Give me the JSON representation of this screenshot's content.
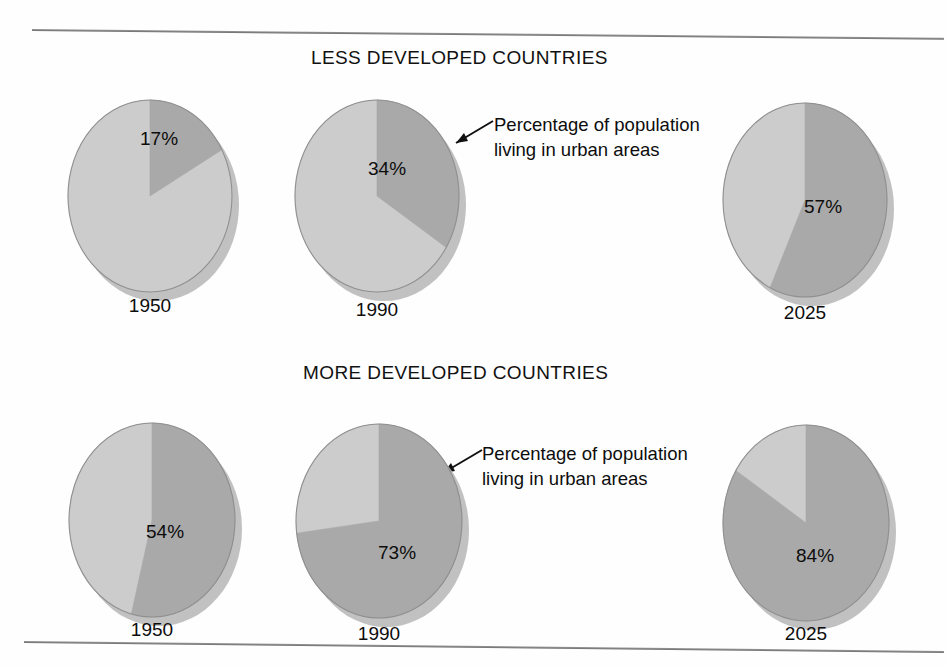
{
  "figure": {
    "background_color": "#fefefe",
    "slice_urban_color": "#a9a9a9",
    "slice_rural_color": "#cccccc",
    "slice_edge_color": "#8f8f8f",
    "shadow_color": "#b6b6b6",
    "text_color": "#0d0d0d"
  },
  "sections": [
    {
      "id": "less",
      "title": "LESS DEVELOPED COUNTRIES"
    },
    {
      "id": "more",
      "title": "MORE DEVELOPED COUNTRIES"
    }
  ],
  "annotations": [
    {
      "id": "top",
      "text": "Percentage of population living in urban areas"
    },
    {
      "id": "bottom",
      "text": "Percentage of population living in urban areas"
    }
  ],
  "pies": [
    {
      "section": "less",
      "year": "1950",
      "value_label": "17%",
      "value": 17
    },
    {
      "section": "less",
      "year": "1990",
      "value_label": "34%",
      "value": 34
    },
    {
      "section": "less",
      "year": "2025",
      "value_label": "57%",
      "value": 57
    },
    {
      "section": "more",
      "year": "1950",
      "value_label": "54%",
      "value": 54
    },
    {
      "section": "more",
      "year": "1990",
      "value_label": "73%",
      "value": 73
    },
    {
      "section": "more",
      "year": "2025",
      "value_label": "84%",
      "value": 84
    }
  ],
  "chart_data": {
    "type": "pie",
    "title": "Percentage of population living in urban areas",
    "xlabel": "",
    "ylabel": "",
    "grid": false,
    "legend_position": "annotation-callout",
    "units": "percent",
    "categories": [
      "Urban",
      "Rural"
    ],
    "panels": [
      {
        "panel_title": "LESS DEVELOPED COUNTRIES",
        "charts": [
          {
            "label": "1950",
            "slices": [
              {
                "name": "Urban",
                "value": 17
              },
              {
                "name": "Rural",
                "value": 83
              }
            ],
            "data_label": "17%"
          },
          {
            "label": "1990",
            "slices": [
              {
                "name": "Urban",
                "value": 34
              },
              {
                "name": "Rural",
                "value": 66
              }
            ],
            "data_label": "34%"
          },
          {
            "label": "2025",
            "slices": [
              {
                "name": "Urban",
                "value": 57
              },
              {
                "name": "Rural",
                "value": 43
              }
            ],
            "data_label": "57%"
          }
        ]
      },
      {
        "panel_title": "MORE DEVELOPED COUNTRIES",
        "charts": [
          {
            "label": "1950",
            "slices": [
              {
                "name": "Urban",
                "value": 54
              },
              {
                "name": "Rural",
                "value": 46
              }
            ],
            "data_label": "54%"
          },
          {
            "label": "1990",
            "slices": [
              {
                "name": "Urban",
                "value": 73
              },
              {
                "name": "Rural",
                "value": 27
              }
            ],
            "data_label": "73%"
          },
          {
            "label": "2025",
            "slices": [
              {
                "name": "Urban",
                "value": 84
              },
              {
                "name": "Rural",
                "value": 16
              }
            ],
            "data_label": "84%"
          }
        ]
      }
    ],
    "annotation_text": "Percentage of population living in urban areas"
  }
}
